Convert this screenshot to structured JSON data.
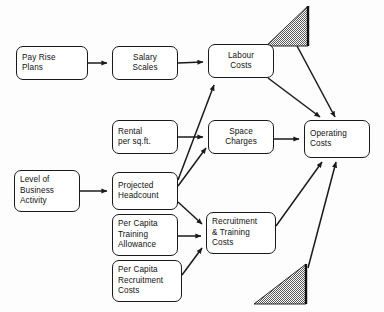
{
  "diagram": {
    "background_color": "#fdfdfd",
    "line_color": "#1a1a1a",
    "node_fill": "#ffffff",
    "nodes": [
      {
        "id": "pay_rise_plans",
        "label": "Pay Rise\nPlans",
        "x": 16,
        "y": 46,
        "w": 72,
        "h": 34,
        "align": "left"
      },
      {
        "id": "salary_scales",
        "label": "Salary\nScales",
        "x": 112,
        "y": 46,
        "w": 66,
        "h": 34,
        "align": "center"
      },
      {
        "id": "labour_costs",
        "label": "Labour\nCosts",
        "x": 208,
        "y": 44,
        "w": 66,
        "h": 34,
        "align": "center"
      },
      {
        "id": "rental_per_sqft",
        "label": "Rental\nper sq.ft.",
        "x": 112,
        "y": 120,
        "w": 66,
        "h": 34,
        "align": "left"
      },
      {
        "id": "space_charges",
        "label": "Space\nCharges",
        "x": 208,
        "y": 120,
        "w": 66,
        "h": 34,
        "align": "center"
      },
      {
        "id": "level_of_business_activity",
        "label": "Level of\nBusiness\nActivity",
        "x": 14,
        "y": 170,
        "w": 66,
        "h": 42,
        "align": "left"
      },
      {
        "id": "projected_headcount",
        "label": "Projected\nHeadcount",
        "x": 112,
        "y": 172,
        "w": 66,
        "h": 38,
        "align": "left"
      },
      {
        "id": "per_capita_training_allowance",
        "label": "Per Capita\nTraining\nAllowance",
        "x": 112,
        "y": 214,
        "w": 66,
        "h": 42,
        "align": "left"
      },
      {
        "id": "per_capita_recruitment_costs",
        "label": "Per Capita\nRecruitment\nCosts",
        "x": 112,
        "y": 260,
        "w": 70,
        "h": 42,
        "align": "left"
      },
      {
        "id": "recruitment_training_costs",
        "label": "Recruitment\n& Training\nCosts",
        "x": 206,
        "y": 212,
        "w": 70,
        "h": 42,
        "align": "left"
      },
      {
        "id": "operating_costs",
        "label": "Operating\nCosts",
        "x": 304,
        "y": 120,
        "w": 66,
        "h": 38,
        "align": "left"
      }
    ],
    "edges": [
      {
        "id": "pay-rise-to-salary",
        "from": "pay_rise_plans",
        "to": "salary_scales",
        "path": "M 88 63 L 107 63",
        "arrow": true
      },
      {
        "id": "salary-to-labour",
        "from": "salary_scales",
        "to": "labour_costs",
        "path": "M 178 63 L 203 62",
        "arrow": true
      },
      {
        "id": "rental-to-space",
        "from": "rental_per_sqft",
        "to": "space_charges",
        "path": "M 178 137 L 203 137",
        "arrow": true
      },
      {
        "id": "level-to-headcount",
        "from": "level_of_business_activity",
        "to": "projected_headcount",
        "path": "M 80 191 L 107 191",
        "arrow": true
      },
      {
        "id": "headcount-to-labour",
        "from": "projected_headcount",
        "to": "labour_costs",
        "path": "M 178 180 L 214 85",
        "arrow": true
      },
      {
        "id": "headcount-to-space",
        "from": "projected_headcount",
        "to": "space_charges",
        "path": "M 178 186 L 206 148",
        "arrow": true
      },
      {
        "id": "headcount-to-recruitment",
        "from": "projected_headcount",
        "to": "recruitment_training_costs",
        "path": "M 178 202 L 202 224",
        "arrow": true
      },
      {
        "id": "training-to-recruitment",
        "from": "per_capita_training_allowance",
        "to": "recruitment_training_costs",
        "path": "M 178 236 L 201 236",
        "arrow": true
      },
      {
        "id": "recruit-cost-to-recruitment",
        "from": "per_capita_recruitment_costs",
        "to": "recruitment_training_costs",
        "path": "M 182 275 L 202 248",
        "arrow": true
      },
      {
        "id": "labour-to-operating",
        "from": "labour_costs",
        "to": "operating_costs",
        "path": "M 268 78 L 320 117",
        "arrow": true
      },
      {
        "id": "space-to-operating",
        "from": "space_charges",
        "to": "operating_costs",
        "path": "M 274 139 L 299 139",
        "arrow": true
      },
      {
        "id": "recruitment-to-operating",
        "from": "recruitment_training_costs",
        "to": "operating_costs",
        "path": "M 276 226 L 322 162",
        "arrow": true
      },
      {
        "id": "top-marker-to-operating",
        "from": "top_marker",
        "to": "operating_costs",
        "path": "M 296 44 L 335 117",
        "arrow": true
      },
      {
        "id": "bottom-marker-to-operating",
        "from": "bottom_marker",
        "to": "operating_costs",
        "path": "M 308 268 L 336 162",
        "arrow": true
      }
    ],
    "markers": [
      {
        "id": "top_marker",
        "shape": "right-triangle",
        "fill": "checker",
        "x": 266,
        "y": 6,
        "w": 42,
        "h": 40,
        "orientation": "right-angle-top-right"
      },
      {
        "id": "bottom_marker",
        "shape": "right-triangle",
        "fill": "checker",
        "x": 254,
        "y": 264,
        "w": 52,
        "h": 40,
        "orientation": "right-angle-top-right"
      }
    ]
  }
}
